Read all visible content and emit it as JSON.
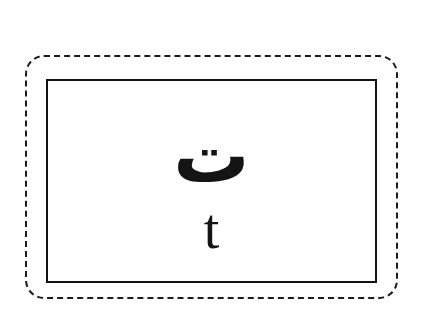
{
  "card": {
    "title": "Arabic Letter Flashcard",
    "arabic_letter": "ت",
    "arabic_letter_name": "teh",
    "transliteration": "t",
    "background_color": "#ffffff",
    "ink_color": "#141414"
  },
  "frames": {
    "outer": {
      "name": "outer-dashed-frame",
      "style": "dashed",
      "corner": "rounded",
      "color": "#1b1b1b"
    },
    "inner": {
      "name": "inner-solid-frame",
      "style": "solid",
      "corner": "square",
      "color": "#121212",
      "fill": "#ffffff"
    }
  }
}
